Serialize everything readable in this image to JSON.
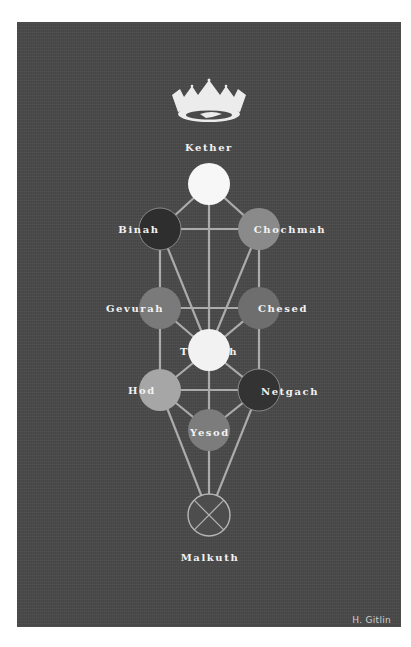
{
  "title_label": "Kether",
  "crown_icon": "crown-icon",
  "signature": "H. Gitlin",
  "colors": {
    "background": "#4a4a4a",
    "path": "#bdbdbd",
    "label": "#f2f2f2"
  },
  "sephirot": [
    {
      "name": "Kether",
      "label": "",
      "cx": 209,
      "cy": 184,
      "fill": "#f7f7f7"
    },
    {
      "name": "Binah",
      "label": "Binah",
      "cx": 160,
      "cy": 229,
      "fill": "#2e2e2e"
    },
    {
      "name": "Chochmah",
      "label": "Chochmah",
      "cx": 259,
      "cy": 229,
      "fill": "#8a8a8a"
    },
    {
      "name": "Gevurah",
      "label": "Gevurah",
      "cx": 160,
      "cy": 308,
      "fill": "#7a7a7a"
    },
    {
      "name": "Chesed",
      "label": "Chesed",
      "cx": 259,
      "cy": 308,
      "fill": "#6e6e6e"
    },
    {
      "name": "Tifereth",
      "label": "Tifereth",
      "cx": 209,
      "cy": 350,
      "fill": "#f2f2f2"
    },
    {
      "name": "Hod",
      "label": "Hod",
      "cx": 160,
      "cy": 390,
      "fill": "#a6a6a6"
    },
    {
      "name": "Netzach",
      "label": "Netzach",
      "cx": 259,
      "cy": 390,
      "fill": "#333333"
    },
    {
      "name": "Yesod",
      "label": "Yesod",
      "cx": 209,
      "cy": 430,
      "fill": "#7c7c7c"
    },
    {
      "name": "Malkuth",
      "label": "Malkuth",
      "cx": 209,
      "cy": 515,
      "fill": "#4d4d4d"
    }
  ],
  "labels": {
    "kether": "Kether",
    "binah": "Binah",
    "chochmah": "Chochmah",
    "gevurah": "Gevurah",
    "chesed": "Chesed",
    "tifereth": "Tifereth",
    "hod": "Hod",
    "netzach": "Netgach",
    "yesod": "Yesod",
    "malkuth": "Malkuth"
  }
}
